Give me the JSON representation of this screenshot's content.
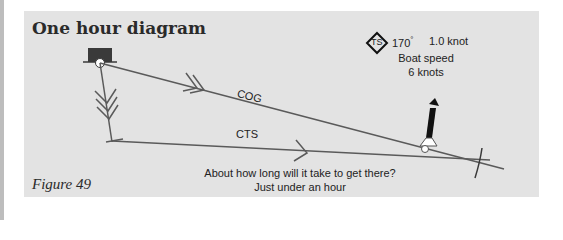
{
  "figure": {
    "title": "One hour diagram",
    "caption": "Figure 49"
  },
  "tide_info": {
    "symbol_icon": "tidal-stream-diamond-icon",
    "symbol_label": "TS",
    "direction": "170",
    "direction_unit": "°",
    "rate": "1.0 knot",
    "boat_speed_label": "Boat speed",
    "boat_speed_value": "6 knots"
  },
  "lines": {
    "cog_label": "COG",
    "cts_label": "CTS"
  },
  "question": {
    "text": "About how long will it take to get there?",
    "answer": "Just under an hour"
  },
  "colors": {
    "panel": "#e3e3e3",
    "line": "#5a5a5a",
    "boat": "#3a3a3a"
  }
}
